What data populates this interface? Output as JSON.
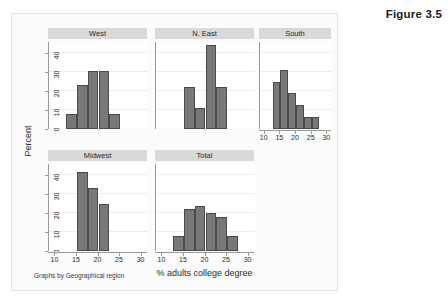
{
  "figure": {
    "number_label": "Figure 3.5",
    "footnote": "Graphs by Geographical region"
  },
  "chart_data": {
    "type": "bar",
    "title": "Figure 3.5",
    "subtitle": "Graphs by Geographical region",
    "xlabel": "% adults college degree",
    "ylabel": "Percent",
    "xlim": [
      8.5,
      31.5
    ],
    "ylim": [
      0,
      46
    ],
    "xticks": [
      10,
      15,
      20,
      25,
      30
    ],
    "yticks": [
      0,
      10,
      20,
      30,
      40
    ],
    "grid": true,
    "legend": "none",
    "bin_width": 2.5,
    "panel_layout": "2 rows x 3 columns",
    "panels": [
      {
        "name": "West",
        "row": 0,
        "col": 0,
        "bins": [
          {
            "x0": 12.5,
            "x1": 15.0,
            "value": 7.7
          },
          {
            "x0": 15.0,
            "x1": 17.5,
            "value": 23.1
          },
          {
            "x0": 17.5,
            "x1": 20.0,
            "value": 30.8
          },
          {
            "x0": 20.0,
            "x1": 22.5,
            "value": 30.8
          },
          {
            "x0": 22.5,
            "x1": 25.0,
            "value": 7.7
          }
        ],
        "show_xaxis": false
      },
      {
        "name": "N. East",
        "row": 0,
        "col": 1,
        "bins": [
          {
            "x0": 15.0,
            "x1": 17.5,
            "value": 22.2
          },
          {
            "x0": 17.5,
            "x1": 20.0,
            "value": 11.1
          },
          {
            "x0": 20.0,
            "x1": 22.5,
            "value": 44.4
          },
          {
            "x0": 22.5,
            "x1": 25.0,
            "value": 22.2
          }
        ],
        "show_xaxis": false
      },
      {
        "name": "South",
        "row": 0,
        "col": 2,
        "bins": [
          {
            "x0": 12.5,
            "x1": 15.0,
            "value": 25.0
          },
          {
            "x0": 15.0,
            "x1": 17.5,
            "value": 31.2
          },
          {
            "x0": 17.5,
            "x1": 20.0,
            "value": 18.8
          },
          {
            "x0": 20.0,
            "x1": 22.5,
            "value": 12.5
          },
          {
            "x0": 22.5,
            "x1": 25.0,
            "value": 6.2
          },
          {
            "x0": 25.0,
            "x1": 27.5,
            "value": 6.2
          }
        ],
        "show_xaxis": true
      },
      {
        "name": "Midwest",
        "row": 1,
        "col": 0,
        "bins": [
          {
            "x0": 15.0,
            "x1": 17.5,
            "value": 41.7
          },
          {
            "x0": 17.5,
            "x1": 20.0,
            "value": 33.3
          },
          {
            "x0": 20.0,
            "x1": 22.5,
            "value": 25.0
          }
        ],
        "show_xaxis": true
      },
      {
        "name": "Total",
        "row": 1,
        "col": 1,
        "bins": [
          {
            "x0": 12.5,
            "x1": 15.0,
            "value": 8.0
          },
          {
            "x0": 15.0,
            "x1": 17.5,
            "value": 22.0
          },
          {
            "x0": 17.5,
            "x1": 20.0,
            "value": 24.0
          },
          {
            "x0": 20.0,
            "x1": 22.5,
            "value": 20.0
          },
          {
            "x0": 22.5,
            "x1": 25.0,
            "value": 18.0
          },
          {
            "x0": 25.0,
            "x1": 27.5,
            "value": 8.0
          }
        ],
        "show_xaxis": true
      }
    ]
  }
}
